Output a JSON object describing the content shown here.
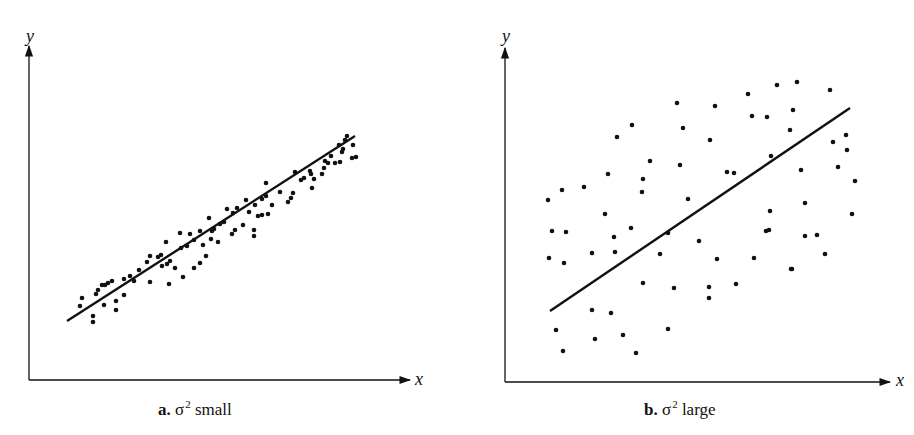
{
  "chart_data": [
    {
      "type": "scatter",
      "panel": "a",
      "caption_letter": "a.",
      "caption_symbol": "σ",
      "caption_exp": "2",
      "caption_text": "small",
      "xlabel": "x",
      "ylabel": "y",
      "grid": false,
      "legend": null,
      "fit_line": {
        "x1": 67,
        "y1": 321,
        "x2": 355,
        "y2": 136
      },
      "points": [
        [
          82,
          298
        ],
        [
          80,
          306
        ],
        [
          93,
          316
        ],
        [
          93,
          322
        ],
        [
          96,
          294
        ],
        [
          98,
          290
        ],
        [
          102,
          285
        ],
        [
          105,
          285
        ],
        [
          108,
          283
        ],
        [
          104,
          305
        ],
        [
          112,
          281
        ],
        [
          116,
          310
        ],
        [
          116,
          301
        ],
        [
          124,
          279
        ],
        [
          124,
          295
        ],
        [
          130,
          276
        ],
        [
          134,
          281
        ],
        [
          139,
          270
        ],
        [
          147,
          262
        ],
        [
          150,
          256
        ],
        [
          150,
          282
        ],
        [
          158,
          257
        ],
        [
          161,
          255
        ],
        [
          162,
          266
        ],
        [
          166,
          242
        ],
        [
          169,
          284
        ],
        [
          167,
          264
        ],
        [
          170,
          261
        ],
        [
          175,
          268
        ],
        [
          180,
          233
        ],
        [
          183,
          277
        ],
        [
          181,
          248
        ],
        [
          187,
          246
        ],
        [
          190,
          234
        ],
        [
          194,
          240
        ],
        [
          200,
          231
        ],
        [
          194,
          268
        ],
        [
          200,
          263
        ],
        [
          206,
          256
        ],
        [
          203,
          245
        ],
        [
          209,
          218
        ],
        [
          211,
          239
        ],
        [
          212,
          231
        ],
        [
          214,
          229
        ],
        [
          220,
          224
        ],
        [
          218,
          242
        ],
        [
          227,
          209
        ],
        [
          224,
          222
        ],
        [
          233,
          213
        ],
        [
          237,
          208
        ],
        [
          235,
          230
        ],
        [
          232,
          234
        ],
        [
          243,
          225
        ],
        [
          254,
          230
        ],
        [
          254,
          236
        ],
        [
          246,
          200
        ],
        [
          249,
          212
        ],
        [
          255,
          205
        ],
        [
          262,
          199
        ],
        [
          266,
          196
        ],
        [
          258,
          216
        ],
        [
          262,
          215
        ],
        [
          268,
          214
        ],
        [
          272,
          205
        ],
        [
          266,
          183
        ],
        [
          280,
          192
        ],
        [
          291,
          198
        ],
        [
          293,
          193
        ],
        [
          288,
          202
        ],
        [
          295,
          172
        ],
        [
          304,
          178
        ],
        [
          310,
          171
        ],
        [
          301,
          180
        ],
        [
          312,
          188
        ],
        [
          314,
          179
        ],
        [
          311,
          174
        ],
        [
          322,
          174
        ],
        [
          325,
          161
        ],
        [
          328,
          163
        ],
        [
          324,
          168
        ],
        [
          331,
          156
        ],
        [
          335,
          163
        ],
        [
          340,
          162
        ],
        [
          343,
          149
        ],
        [
          339,
          145
        ],
        [
          342,
          152
        ],
        [
          345,
          140
        ],
        [
          347,
          136
        ],
        [
          353,
          145
        ],
        [
          356,
          157
        ],
        [
          352,
          158
        ]
      ],
      "axes": {
        "origin": [
          29,
          380
        ],
        "x_end": 410,
        "y_end": 46
      }
    },
    {
      "type": "scatter",
      "panel": "b",
      "caption_letter": "b.",
      "caption_symbol": "σ",
      "caption_exp": "2",
      "caption_text": "large",
      "xlabel": "x",
      "ylabel": "y",
      "grid": false,
      "legend": null,
      "fit_line": {
        "x1": 550,
        "y1": 311,
        "x2": 850,
        "y2": 108
      },
      "points": [
        [
          548,
          200
        ],
        [
          562,
          190
        ],
        [
          584,
          187
        ],
        [
          608,
          174
        ],
        [
          617,
          137
        ],
        [
          632,
          125
        ],
        [
          650,
          161
        ],
        [
          642,
          192
        ],
        [
          677,
          103
        ],
        [
          683,
          128
        ],
        [
          680,
          165
        ],
        [
          715,
          106
        ],
        [
          710,
          140
        ],
        [
          727,
          172
        ],
        [
          748,
          94
        ],
        [
          752,
          116
        ],
        [
          777,
          85
        ],
        [
          767,
          117
        ],
        [
          771,
          156
        ],
        [
          797,
          82
        ],
        [
          793,
          110
        ],
        [
          790,
          130
        ],
        [
          830,
          90
        ],
        [
          833,
          142
        ],
        [
          846,
          135
        ],
        [
          847,
          150
        ],
        [
          838,
          167
        ],
        [
          855,
          181
        ],
        [
          552,
          231
        ],
        [
          566,
          232
        ],
        [
          605,
          214
        ],
        [
          614,
          237
        ],
        [
          643,
          179
        ],
        [
          631,
          228
        ],
        [
          688,
          199
        ],
        [
          734,
          173
        ],
        [
          805,
          203
        ],
        [
          801,
          170
        ],
        [
          770,
          211
        ],
        [
          769,
          230
        ],
        [
          817,
          235
        ],
        [
          852,
          214
        ],
        [
          549,
          258
        ],
        [
          564,
          263
        ],
        [
          592,
          253
        ],
        [
          615,
          252
        ],
        [
          660,
          254
        ],
        [
          668,
          233
        ],
        [
          699,
          241
        ],
        [
          717,
          259
        ],
        [
          754,
          258
        ],
        [
          766,
          231
        ],
        [
          805,
          236
        ],
        [
          825,
          254
        ],
        [
          792,
          269
        ],
        [
          643,
          283
        ],
        [
          674,
          288
        ],
        [
          709,
          287
        ],
        [
          709,
          298
        ],
        [
          736,
          284
        ],
        [
          791,
          269
        ],
        [
          556,
          330
        ],
        [
          563,
          351
        ],
        [
          592,
          310
        ],
        [
          595,
          339
        ],
        [
          611,
          313
        ],
        [
          623,
          335
        ],
        [
          636,
          353
        ],
        [
          668,
          329
        ]
      ],
      "axes": {
        "origin": [
          505,
          382
        ],
        "x_end": 890,
        "y_end": 48
      }
    }
  ]
}
